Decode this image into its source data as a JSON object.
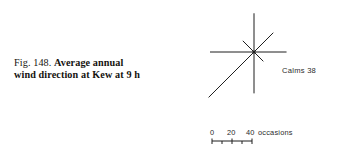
{
  "figure": {
    "caption_label": "Fig. 148.",
    "caption_line_1": "Average annual",
    "caption_line_2": "wind direction at Kew at 9 h",
    "calms_label": "Calms 38",
    "units_label": "occasions",
    "ink_color": "#1f1f1f",
    "background_color": "#ffffff"
  },
  "scale": {
    "tick_labels": [
      "0",
      "20",
      "40"
    ],
    "tick_values": [
      0,
      20,
      40
    ],
    "units": "occasions"
  },
  "chart_data": {
    "type": "line",
    "title": "Average annual wind direction at Kew at 9 h",
    "subtype": "wind-rose",
    "xlabel": "",
    "ylabel": "occasions",
    "grid": false,
    "legend": "none",
    "annotations": [
      "Calms 38"
    ],
    "axis_units": "occasions",
    "axis_range": [
      0,
      40
    ],
    "scale_ticks": [
      0,
      20,
      40
    ],
    "categories": [
      "N",
      "NE",
      "E",
      "SE",
      "S",
      "SW",
      "W",
      "NW"
    ],
    "values": [
      44,
      31,
      37,
      15,
      47,
      73,
      50,
      18
    ],
    "series": [
      {
        "name": "Average annual wind direction at Kew at 9 h",
        "directions": [
          "N",
          "NE",
          "E",
          "SE",
          "S",
          "SW",
          "W",
          "NW"
        ],
        "bearings_deg": [
          0,
          45,
          90,
          135,
          180,
          225,
          270,
          315
        ],
        "values": [
          44,
          31,
          37,
          15,
          47,
          73,
          50,
          18
        ]
      }
    ],
    "calms": 38
  }
}
